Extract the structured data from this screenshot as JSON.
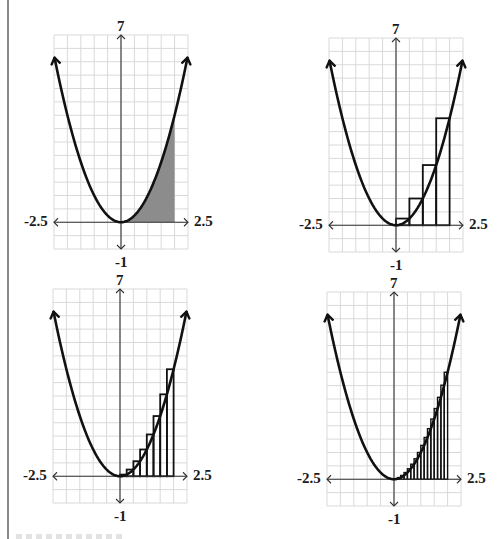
{
  "figure": {
    "function": "y = x^2",
    "colors": {
      "grid": "#d9d9d9",
      "axis": "#333333",
      "curve": "#111111",
      "shade": "#8c8c8c",
      "rect_stroke": "#111111"
    }
  },
  "chart_data": [
    {
      "type": "area",
      "title": "",
      "function": "x^2",
      "xlim": [
        -2.5,
        2.5
      ],
      "ylim": [
        -1,
        7
      ],
      "grid": true,
      "grid_step": 0.5,
      "tick_labels": {
        "x_min": "-2.5",
        "x_max": "2.5",
        "y_max": "7",
        "y_min": "-1"
      },
      "shaded_interval": [
        0,
        2
      ],
      "description": "Exact area under y=x^2 from 0 to 2 shaded"
    },
    {
      "type": "bar",
      "function": "x^2",
      "xlim": [
        -2.5,
        2.5
      ],
      "ylim": [
        -1,
        7
      ],
      "grid": true,
      "grid_step": 0.5,
      "tick_labels": {
        "x_min": "-2.5",
        "x_max": "2.5",
        "y_max": "7",
        "y_min": "-1"
      },
      "rectangles": {
        "n": 4,
        "width": 0.5,
        "method": "right-endpoint",
        "x": [
          0,
          0.5,
          1.0,
          1.5
        ],
        "heights": [
          0.25,
          1.0,
          2.25,
          4.0
        ]
      }
    },
    {
      "type": "bar",
      "function": "x^2",
      "xlim": [
        -2.5,
        2.5
      ],
      "ylim": [
        -1,
        7
      ],
      "grid": true,
      "grid_step": 0.5,
      "tick_labels": {
        "x_min": "-2.5",
        "x_max": "2.5",
        "y_max": "7",
        "y_min": "-1"
      },
      "rectangles": {
        "n": 8,
        "width": 0.25,
        "method": "right-endpoint",
        "x": [
          0,
          0.25,
          0.5,
          0.75,
          1.0,
          1.25,
          1.5,
          1.75
        ],
        "heights": [
          0.0625,
          0.25,
          0.5625,
          1.0,
          1.5625,
          2.25,
          3.0625,
          4.0
        ]
      }
    },
    {
      "type": "bar",
      "function": "x^2",
      "xlim": [
        -2.5,
        2.5
      ],
      "ylim": [
        -1,
        7
      ],
      "grid": true,
      "grid_step": 0.5,
      "tick_labels": {
        "x_min": "-2.5",
        "x_max": "2.5",
        "y_max": "7",
        "y_min": "-1"
      },
      "rectangles": {
        "n": 16,
        "width": 0.125,
        "method": "right-endpoint",
        "x": [
          0,
          0.125,
          0.25,
          0.375,
          0.5,
          0.625,
          0.75,
          0.875,
          1.0,
          1.125,
          1.25,
          1.375,
          1.5,
          1.625,
          1.75,
          1.875
        ],
        "heights": [
          0.015625,
          0.0625,
          0.140625,
          0.25,
          0.390625,
          0.5625,
          0.765625,
          1.0,
          1.265625,
          1.5625,
          1.890625,
          2.25,
          2.640625,
          3.0625,
          3.515625,
          4.0
        ]
      }
    }
  ],
  "panels": [
    {
      "id": "p1",
      "left": 54,
      "top": 35,
      "labels": {
        "top": "7",
        "bottom": "-1",
        "left": "-2.5",
        "right": "2.5"
      }
    },
    {
      "id": "p2",
      "left": 329,
      "top": 38,
      "labels": {
        "top": "7",
        "bottom": "-1",
        "left": "-2.5",
        "right": "2.5"
      }
    },
    {
      "id": "p3",
      "left": 53,
      "top": 289,
      "labels": {
        "top": "7",
        "bottom": "-1",
        "left": "-2.5",
        "right": "2.5"
      }
    },
    {
      "id": "p4",
      "left": 327,
      "top": 292,
      "labels": {
        "top": "7",
        "bottom": "-1",
        "left": "-2.5",
        "right": "2.5"
      }
    }
  ]
}
